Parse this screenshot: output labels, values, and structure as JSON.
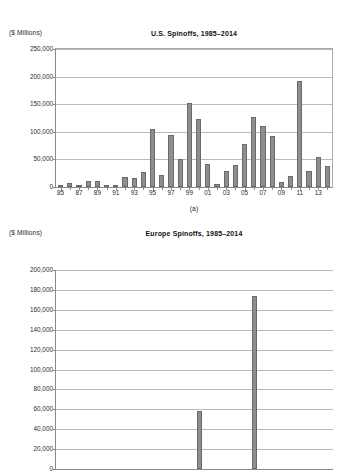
{
  "figure": {
    "panel_a_caption": "(a)",
    "bar_color": "#8e8e8e",
    "bar_edge_color": "#6a6a6a",
    "grid_color": "#b9b9b9",
    "axis_color": "#8a8a8a"
  },
  "chart_data": [
    {
      "id": "us-spinoffs",
      "type": "bar",
      "title": "U.S. Spinoffs, 1985–2014",
      "ylabel": "($ Millions)",
      "xlabel": "",
      "unit_label": "($ Millions)",
      "grid": true,
      "legend": "none",
      "ylim": [
        0,
        250000
      ],
      "yticks": [
        0,
        50000,
        100000,
        150000,
        200000,
        250000
      ],
      "ytick_labels": [
        "0",
        "50,000",
        "100,000",
        "150,000",
        "200,000",
        "250,000"
      ],
      "categories": [
        "85",
        "86",
        "87",
        "88",
        "89",
        "90",
        "91",
        "92",
        "93",
        "94",
        "95",
        "96",
        "97",
        "98",
        "99",
        "00",
        "01",
        "02",
        "03",
        "04",
        "05",
        "06",
        "07",
        "08",
        "09",
        "10",
        "11",
        "12",
        "13",
        "14"
      ],
      "xtick_labels": [
        "85",
        "87",
        "89",
        "91",
        "93",
        "95",
        "97",
        "99",
        "01",
        "03",
        "05",
        "07",
        "09",
        "11",
        "13"
      ],
      "values": [
        1500,
        6500,
        4500,
        10000,
        10500,
        4000,
        3500,
        18000,
        16500,
        28000,
        105000,
        22000,
        94500,
        51000,
        152000,
        123500,
        41500,
        5500,
        29000,
        40500,
        77500,
        127000,
        111000,
        93000,
        8500,
        20000,
        192500,
        28500,
        54500,
        38000
      ]
    },
    {
      "id": "europe-spinoffs",
      "type": "bar",
      "title": "Europe Spinoffs, 1985–2014",
      "ylabel": "($ Millions)",
      "xlabel": "",
      "unit_label": "($ Millions)",
      "grid": true,
      "legend": "none",
      "note": "Panel cropped by screenshot edge below the 60,000 gridline",
      "ylim": [
        0,
        200000
      ],
      "yticks": [
        0,
        20000,
        40000,
        60000,
        80000,
        100000,
        120000,
        140000,
        160000,
        180000,
        200000
      ],
      "ytick_labels": [
        "0",
        "20,000",
        "40,000",
        "60,000",
        "80,000",
        "100,000",
        "120,000",
        "140,000",
        "160,000",
        "180,000",
        "200,000"
      ],
      "visible_ytick_labels": [
        "200,000",
        "180,000",
        "160,000",
        "140,000",
        "120,000",
        "100,000",
        "80,000",
        "60,000"
      ],
      "categories": [
        "85",
        "86",
        "87",
        "88",
        "89",
        "90",
        "91",
        "92",
        "93",
        "94",
        "95",
        "96",
        "97",
        "98",
        "99",
        "00",
        "01",
        "02",
        "03",
        "04",
        "05",
        "06",
        "07",
        "08",
        "09",
        "10",
        "11",
        "12",
        "13",
        "14"
      ],
      "values": [
        0,
        0,
        0,
        0,
        0,
        0,
        0,
        0,
        0,
        0,
        0,
        0,
        0,
        0,
        0,
        58000,
        0,
        0,
        0,
        0,
        0,
        174000,
        0,
        0,
        0,
        0,
        0,
        0,
        0,
        0
      ]
    }
  ]
}
